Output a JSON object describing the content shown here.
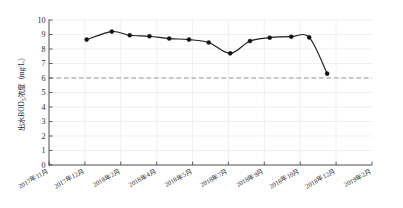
{
  "chart_data": {
    "type": "line",
    "title": "",
    "xlabel": "",
    "ylabel": "出水BOD5浓度（mg/L）",
    "ylabel_parts": {
      "prefix": "出水BOD",
      "subscript": "5",
      "suffix": "浓度（mg/L）"
    },
    "ylim": [
      0,
      10
    ],
    "ytick_labels": [
      "0",
      "1",
      "2",
      "3",
      "4",
      "5",
      "6",
      "7",
      "8",
      "9",
      "10"
    ],
    "ytick_values": [
      0,
      1,
      2,
      3,
      4,
      5,
      6,
      7,
      8,
      9,
      10
    ],
    "xtick_labels": [
      "2017年11月",
      "2017年12月",
      "2018年2月",
      "2018年4月",
      "2018年5月",
      "2018年7月",
      "2018年9月",
      "2018年10月",
      "2018年12月",
      "2019年2月"
    ],
    "grid": true,
    "grid_axis": "y",
    "legend": false,
    "series": [
      {
        "name": "出水BOD5浓度",
        "color": "#1c1c1c",
        "marker": "filled-circle",
        "x": [
          1.05,
          1.75,
          2.25,
          2.8,
          3.35,
          3.9,
          4.45,
          5.05,
          5.6,
          6.15,
          6.75,
          7.25,
          7.75
        ],
        "values": [
          8.65,
          9.2,
          8.95,
          8.88,
          8.72,
          8.65,
          8.45,
          7.7,
          8.55,
          8.78,
          8.85,
          8.8,
          6.3
        ]
      }
    ],
    "annotations": [
      {
        "type": "threshold-line",
        "orientation": "horizontal",
        "value": 6.0,
        "style": "dashed",
        "color": "#8d8d8d",
        "label": ""
      }
    ]
  }
}
